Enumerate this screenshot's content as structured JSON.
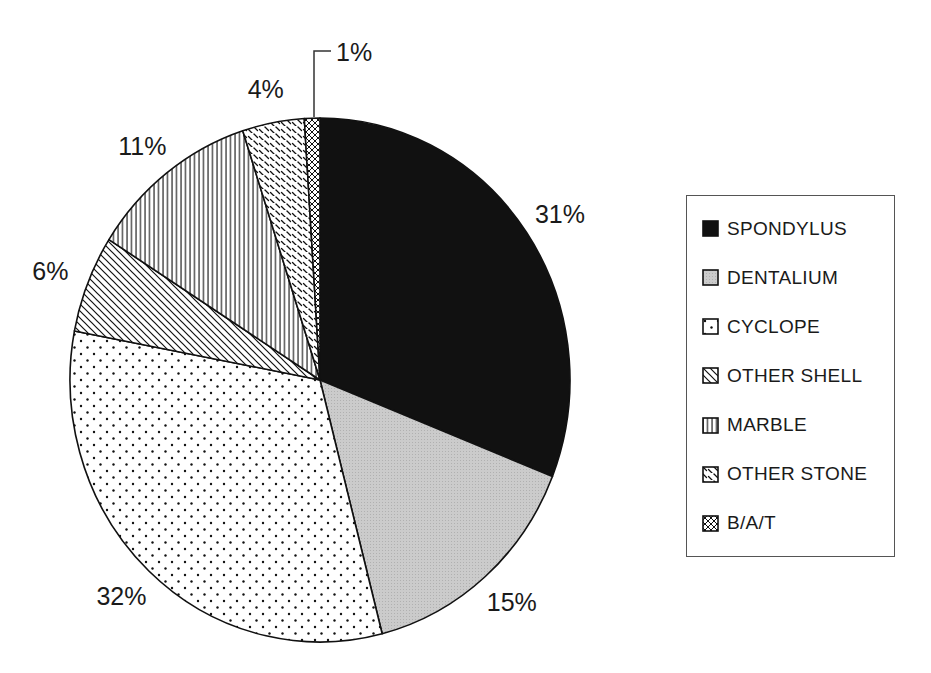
{
  "figure": {
    "kind": "black-and-white pie chart figure",
    "background": "#ffffff",
    "ink": "#111111",
    "gray_fill": "#c8c8c8"
  },
  "chart_data": {
    "type": "pie",
    "start_angle_deg": 0,
    "direction": "clockwise",
    "grid": false,
    "slices": [
      {
        "label": "SPONDYLUS",
        "value_pct": 31,
        "display": "31%",
        "pattern": "solid-black"
      },
      {
        "label": "DENTALIUM",
        "value_pct": 15,
        "display": "15%",
        "pattern": "gray-halftone"
      },
      {
        "label": "CYCLOPE",
        "value_pct": 32,
        "display": "32%",
        "pattern": "white-dots"
      },
      {
        "label": "OTHER SHELL",
        "value_pct": 6,
        "display": "6%",
        "pattern": "diagonal-lines"
      },
      {
        "label": "MARBLE",
        "value_pct": 11,
        "display": "11%",
        "pattern": "vertical-lines"
      },
      {
        "label": "OTHER STONE",
        "value_pct": 4,
        "display": "4%",
        "pattern": "diagonal-dashes"
      },
      {
        "label": "B/A/T",
        "value_pct": 1,
        "display": "1%",
        "pattern": "crosshatch"
      }
    ],
    "legend": {
      "position": "right",
      "entries": [
        "SPONDYLUS",
        "DENTALIUM",
        "CYCLOPE",
        "OTHER SHELL",
        "MARBLE",
        "OTHER STONE",
        "B/A/T"
      ]
    }
  }
}
